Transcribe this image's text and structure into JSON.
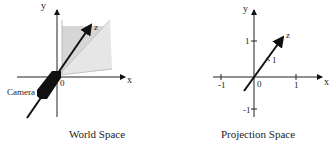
{
  "world_space": {
    "caption": "World Space",
    "axis_labels": {
      "x": "x",
      "y": "y",
      "z": "z"
    },
    "origin_label": "0",
    "camera_label": "Camera",
    "frustum_color": "#d9d9d9"
  },
  "projection_space": {
    "caption": "Projection Space",
    "axis_labels": {
      "x": "x",
      "y": "y",
      "z": "z"
    },
    "origin_label": "0",
    "x_ticks": [
      "-1",
      "1"
    ],
    "y_ticks": [
      "1",
      "-1"
    ],
    "z_tick": "1"
  }
}
